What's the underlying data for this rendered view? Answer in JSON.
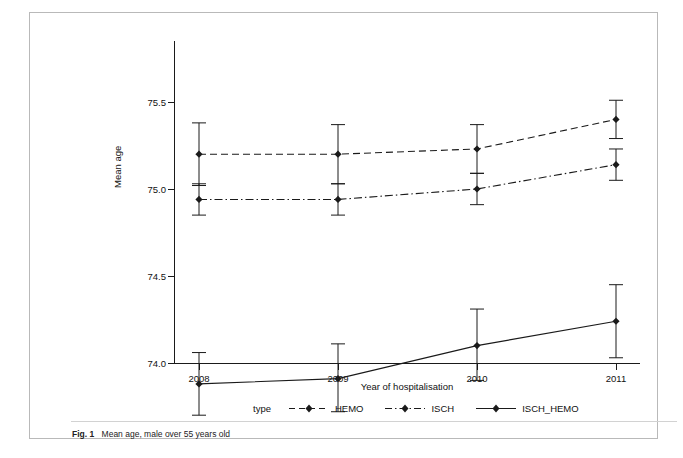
{
  "figure": {
    "caption_label": "Fig. 1",
    "caption_text": "Mean age, male over 55 years old"
  },
  "chart_data": {
    "type": "line",
    "title": "",
    "xlabel": "Year of hospitalisation",
    "ylabel": "Mean age",
    "categories": [
      "2008",
      "2009",
      "2010",
      "2011"
    ],
    "x_tick_labels": [
      "2008",
      "2009",
      "2010",
      "2011"
    ],
    "y_tick_labels": [
      "74.0",
      "74.5",
      "75.0",
      "75.5"
    ],
    "y_tick_values": [
      74.0,
      74.5,
      75.0,
      75.5
    ],
    "ylim": [
      73.75,
      75.6
    ],
    "grid": false,
    "legend_position": "bottom",
    "legend_title": "type",
    "error_bars": true,
    "series": [
      {
        "name": "HEMO",
        "line_style": "dashed",
        "marker": "diamond",
        "values": [
          75.2,
          75.2,
          75.23,
          75.4
        ],
        "err_low": [
          75.02,
          75.03,
          75.09,
          75.29
        ],
        "err_high": [
          75.38,
          75.37,
          75.37,
          75.51
        ]
      },
      {
        "name": "ISCH",
        "line_style": "dash-dot",
        "marker": "diamond",
        "values": [
          74.94,
          74.94,
          75.0,
          75.14
        ],
        "err_low": [
          74.85,
          74.85,
          74.91,
          75.05
        ],
        "err_high": [
          75.03,
          75.03,
          75.09,
          75.23
        ]
      },
      {
        "name": "ISCH_HEMO",
        "line_style": "solid",
        "marker": "diamond",
        "values": [
          73.88,
          73.91,
          74.1,
          74.24
        ],
        "err_low": [
          73.7,
          73.72,
          73.9,
          74.03
        ],
        "err_high": [
          74.06,
          74.11,
          74.31,
          74.45
        ]
      }
    ],
    "legend_entries": [
      {
        "label": "HEMO",
        "line_style": "dashed",
        "marker": "diamond"
      },
      {
        "label": "ISCH",
        "line_style": "dash-dot",
        "marker": "diamond"
      },
      {
        "label": "ISCH_HEMO",
        "line_style": "solid",
        "marker": "diamond"
      }
    ]
  },
  "colors": {
    "line": "#1a1a1a",
    "axis": "#1a1a1a",
    "frame": "#b9b9b9",
    "background": "#ffffff"
  }
}
